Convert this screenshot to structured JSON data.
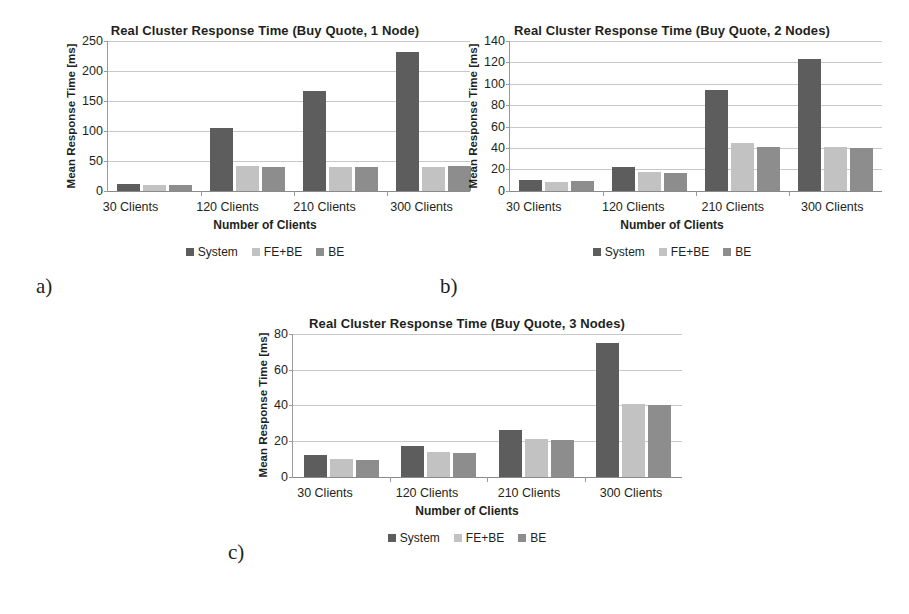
{
  "figure": {
    "background": "#ffffff",
    "panel_tags": {
      "a": "a)",
      "b": "b)",
      "c": "c)"
    }
  },
  "series_colors": {
    "System": "#5d5d5d",
    "FE+BE": "#c2c2c2",
    "BE": "#8d8d8d"
  },
  "legend_labels": {
    "system": "System",
    "febe": "FE+BE",
    "be": "BE"
  },
  "chart_data": [
    {
      "type": "bar",
      "panel": "a)",
      "title": "Real Cluster Response Time (Buy Quote, 1 Node)",
      "xlabel": "Number of Clients",
      "ylabel": "Mean Response Time [ms]",
      "categories": [
        "30 Clients",
        "120 Clients",
        "210 Clients",
        "300 Clients"
      ],
      "series": [
        {
          "name": "System",
          "color": "#5d5d5d",
          "values": [
            12,
            104,
            167,
            232
          ]
        },
        {
          "name": "FE+BE",
          "color": "#c2c2c2",
          "values": [
            9,
            41,
            39,
            39
          ]
        },
        {
          "name": "BE",
          "color": "#8d8d8d",
          "values": [
            9,
            40,
            40,
            41
          ]
        }
      ],
      "ylim": [
        0,
        250
      ],
      "yticks": [
        0,
        50,
        100,
        150,
        200,
        250
      ],
      "ytick_labels": [
        "0",
        "50",
        "100",
        "150",
        "200",
        "250"
      ],
      "grid": true,
      "legend_position": "bottom"
    },
    {
      "type": "bar",
      "panel": "b)",
      "title": "Real Cluster Response Time (Buy Quote, 2 Nodes)",
      "xlabel": "Number of Clients",
      "ylabel": "Mean Response Time [ms]",
      "categories": [
        "30 Clients",
        "120 Clients",
        "210 Clients",
        "300 Clients"
      ],
      "series": [
        {
          "name": "System",
          "color": "#5d5d5d",
          "values": [
            10,
            22,
            94,
            123
          ]
        },
        {
          "name": "FE+BE",
          "color": "#c2c2c2",
          "values": [
            8,
            18,
            45,
            41
          ]
        },
        {
          "name": "BE",
          "color": "#8d8d8d",
          "values": [
            9,
            17,
            41,
            40
          ]
        }
      ],
      "ylim": [
        0,
        140
      ],
      "yticks": [
        0,
        20,
        40,
        60,
        80,
        100,
        120,
        140
      ],
      "ytick_labels": [
        "0",
        "20",
        "40",
        "60",
        "80",
        "100",
        "120",
        "140"
      ],
      "grid": true,
      "legend_position": "bottom"
    },
    {
      "type": "bar",
      "panel": "c)",
      "title": "Real Cluster Response Time (Buy Quote, 3 Nodes)",
      "xlabel": "Number of Clients",
      "ylabel": "Mean Response Time [ms]",
      "categories": [
        "30 Clients",
        "120 Clients",
        "210 Clients",
        "300 Clients"
      ],
      "series": [
        {
          "name": "System",
          "color": "#5d5d5d",
          "values": [
            12,
            17,
            26,
            75
          ]
        },
        {
          "name": "FE+BE",
          "color": "#c2c2c2",
          "values": [
            10,
            14,
            21,
            41
          ]
        },
        {
          "name": "BE",
          "color": "#8d8d8d",
          "values": [
            9.5,
            13.5,
            20.5,
            40
          ]
        }
      ],
      "ylim": [
        0,
        80
      ],
      "yticks": [
        0,
        20,
        40,
        60,
        80
      ],
      "ytick_labels": [
        "0",
        "20",
        "40",
        "60",
        "80"
      ],
      "grid": true,
      "legend_position": "bottom"
    }
  ]
}
